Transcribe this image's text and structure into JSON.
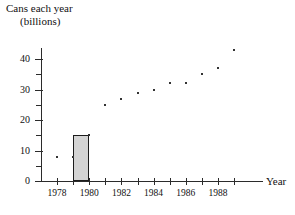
{
  "title": {
    "line1": "Cans each year",
    "line2": "(billions)"
  },
  "axis": {
    "x_name": "Year"
  },
  "chart_data": {
    "type": "scatter",
    "title": "Cans each year (billions)",
    "xlabel": "Year",
    "ylabel": "Cans each year (billions)",
    "xlim": [
      1977,
      1990
    ],
    "ylim": [
      0,
      45
    ],
    "grid": false,
    "legend": "none",
    "y_ticks_major": [
      0,
      10,
      20,
      30,
      40
    ],
    "y_ticks_minor": [
      5,
      15,
      25,
      35
    ],
    "x_ticks": [
      1978,
      1979,
      1980,
      1981,
      1982,
      1983,
      1984,
      1985,
      1986,
      1987,
      1988,
      1989
    ],
    "x_tick_labels": [
      "1978",
      "",
      "1980",
      "",
      "1982",
      "",
      "1984",
      "",
      "1986",
      "",
      "1988",
      ""
    ],
    "x": [
      1978,
      1979,
      1980,
      1981,
      1982,
      1983,
      1984,
      1985,
      1986,
      1987,
      1988,
      1989
    ],
    "values": [
      8,
      8,
      15,
      25,
      27,
      29,
      30,
      32,
      32,
      35,
      37,
      43
    ],
    "point_color": "#333333",
    "annotation": {
      "kind": "rectangle",
      "x_start": 1979,
      "x_end": 1980,
      "y_bottom": 0,
      "y_top": 15,
      "fill": "#d4d4d4",
      "stroke": "#1c1c1c"
    }
  },
  "y_tick_labels": [
    "0",
    "10",
    "20",
    "30",
    "40"
  ]
}
